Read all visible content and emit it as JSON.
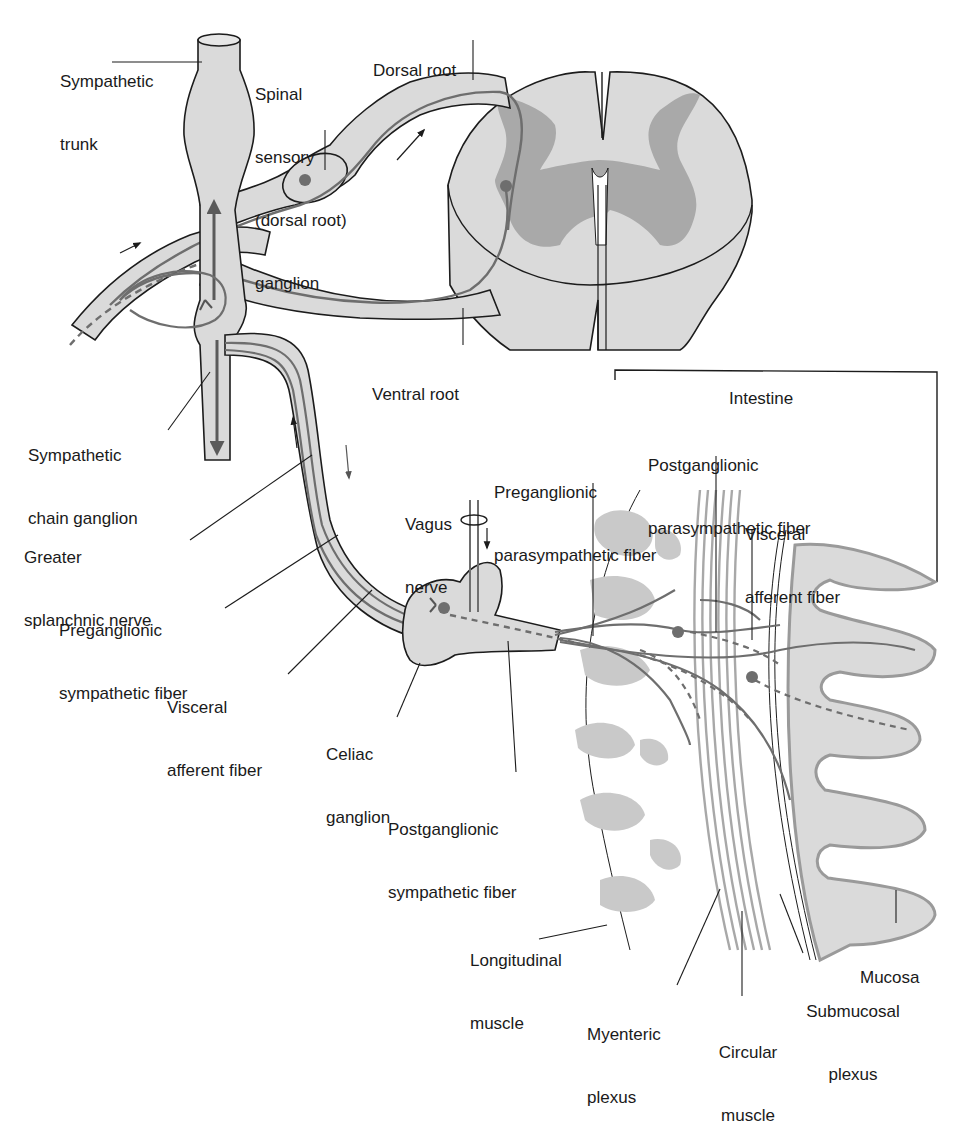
{
  "colors": {
    "tissue_fill": "#dadada",
    "gray_matter": "#a9a9a9",
    "outline": "#1c1c1c",
    "fiber": "#6e6e6e",
    "plexus_fill": "#c9c9c9",
    "mucosa_border": "#9a9a9a"
  },
  "labels": {
    "sympathetic_trunk": [
      "Sympathetic",
      "trunk"
    ],
    "spinal_sensory_ganglion": [
      "Spinal",
      "sensory",
      "(dorsal root)",
      "ganglion"
    ],
    "dorsal_root": [
      "Dorsal root"
    ],
    "ventral_root": [
      "Ventral root"
    ],
    "intestine": [
      "Intestine"
    ],
    "sympathetic_chain_ganglion": [
      "Sympathetic",
      "chain ganglion"
    ],
    "greater_splanchnic_nerve": [
      "Greater",
      "splanchnic nerve"
    ],
    "preganglionic_sympathetic_fiber": [
      "Preganglionic",
      "sympathetic fiber"
    ],
    "visceral_afferent_fiber_left": [
      "Visceral",
      "afferent fiber"
    ],
    "celiac_ganglion": [
      "Celiac",
      "ganglion"
    ],
    "postganglionic_sympathetic_fiber": [
      "Postganglionic",
      "sympathetic fiber"
    ],
    "vagus_nerve": [
      "Vagus",
      "nerve"
    ],
    "preganglionic_parasympathetic_fiber": [
      "Preganglionic",
      "parasympathetic fiber"
    ],
    "postganglionic_parasympathetic_fiber": [
      "Postganglionic",
      "parasympathetic fiber"
    ],
    "visceral_afferent_fiber_right": [
      "Visceral",
      "afferent fiber"
    ],
    "longitudinal_muscle": [
      "Longitudinal",
      "muscle"
    ],
    "myenteric_plexus": [
      "Myenteric",
      "plexus"
    ],
    "circular_muscle": [
      "Circular",
      "muscle"
    ],
    "submucosal_plexus": [
      "Submucosal",
      "plexus"
    ],
    "mucosa": [
      "Mucosa"
    ]
  }
}
